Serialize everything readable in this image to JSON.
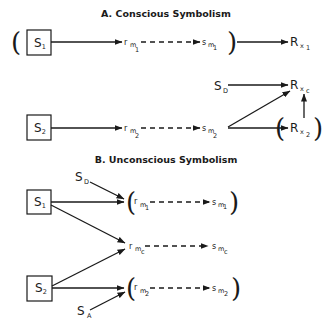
{
  "sections": {
    "a": {
      "title": "A.  Conscious Symbolism",
      "row1": {
        "stimulus": {
          "main": "S",
          "sub": "1"
        },
        "r_m": {
          "main": "r",
          "sub1": "m",
          "sub2": "1"
        },
        "s_m": {
          "main": "s",
          "sub1": "m",
          "sub2": "1"
        },
        "response": {
          "main": "R",
          "sub1": "x",
          "sub2": "1"
        }
      },
      "row2": {
        "stimulus": {
          "main": "S",
          "sub": "2"
        },
        "r_m": {
          "main": "r",
          "sub1": "m",
          "sub2": "2"
        },
        "s_m": {
          "main": "s",
          "sub1": "m",
          "sub2": "2"
        },
        "drive": {
          "main": "S",
          "sub": "D"
        },
        "response_c": {
          "main": "R",
          "sub1": "x",
          "sub2": "c"
        },
        "response_2": {
          "main": "R",
          "sub1": "x",
          "sub2": "2"
        }
      }
    },
    "b": {
      "title": "B.  Unconscious Symbolism",
      "drive": {
        "main": "S",
        "sub": "D"
      },
      "anxiety": {
        "main": "S",
        "sub": "A"
      },
      "stimulus1": {
        "main": "S",
        "sub": "1"
      },
      "stimulus2": {
        "main": "S",
        "sub": "2"
      },
      "row1": {
        "r_m": {
          "main": "r",
          "sub1": "m",
          "sub2": "1"
        },
        "s_m": {
          "main": "s",
          "sub1": "m",
          "sub2": "1"
        }
      },
      "rowc": {
        "r_m": {
          "main": "r",
          "sub1": "m",
          "sub2": "c"
        },
        "s_m": {
          "main": "s",
          "sub1": "m",
          "sub2": "c"
        }
      },
      "row2": {
        "r_m": {
          "main": "r",
          "sub1": "m",
          "sub2": "2"
        },
        "s_m": {
          "main": "s",
          "sub1": "m",
          "sub2": "2"
        }
      }
    }
  },
  "colors": {
    "ink": "#1a1a1a",
    "background": "#ffffff"
  }
}
